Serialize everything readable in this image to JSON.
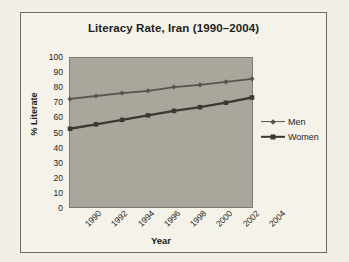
{
  "chart_data": {
    "type": "line",
    "title": "Literacy Rate, Iran (1990–2004)",
    "xlabel": "Year",
    "ylabel": "% Literate",
    "x": [
      1990,
      1992,
      1994,
      1996,
      1998,
      2000,
      2002,
      2004
    ],
    "xtick_labels": [
      "1990",
      "1992",
      "1994",
      "1996",
      "1998",
      "2000",
      "2002",
      "2004"
    ],
    "ytick_labels": [
      "100",
      "90",
      "80",
      "70",
      "60",
      "50",
      "40",
      "30",
      "20",
      "10",
      "0"
    ],
    "xlim": [
      1990,
      2004
    ],
    "ylim": [
      0,
      100
    ],
    "ytick_step": 10,
    "grid": false,
    "legend_position": "right",
    "plot_background": "#a9a79c",
    "series": [
      {
        "name": "Men",
        "color": "#55544d",
        "marker": "diamond",
        "values": [
          72.5,
          74.5,
          76.5,
          78,
          80.5,
          82,
          84,
          86
        ]
      },
      {
        "name": "Women",
        "color": "#3a3933",
        "marker": "square",
        "values": [
          52.5,
          55.5,
          58.5,
          61.5,
          64.5,
          67,
          70,
          73.5
        ]
      }
    ]
  },
  "legend": {
    "items": [
      {
        "label": "Men"
      },
      {
        "label": "Women"
      }
    ]
  }
}
